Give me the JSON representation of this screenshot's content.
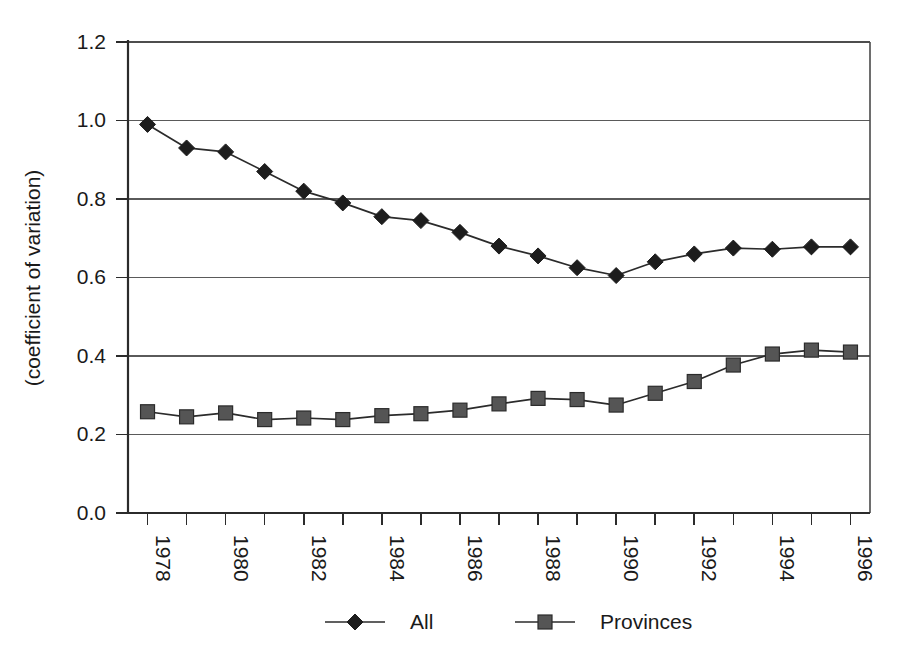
{
  "chart_data": {
    "type": "line",
    "title": "",
    "subtitle": "",
    "xlabel": "",
    "ylabel": "(coefficient of variation)",
    "grid": true,
    "legend_position": "bottom",
    "xlim": [
      1978,
      1997
    ],
    "ylim": [
      0.0,
      1.2
    ],
    "ytick_labels": [
      "0.0",
      "0.2",
      "0.4",
      "0.6",
      "0.8",
      "1.0",
      "1.2"
    ],
    "ytick_values": [
      0.0,
      0.2,
      0.4,
      0.6,
      0.8,
      1.0,
      1.2
    ],
    "x": [
      1978,
      1979,
      1980,
      1981,
      1982,
      1983,
      1984,
      1985,
      1986,
      1987,
      1988,
      1989,
      1990,
      1991,
      1992,
      1993,
      1994,
      1995,
      1996
    ],
    "xtick_labels": [
      "1978",
      "",
      "1980",
      "",
      "1982",
      "",
      "1984",
      "",
      "1986",
      "",
      "1988",
      "",
      "1990",
      "",
      "1992",
      "",
      "1994",
      "",
      "1996"
    ],
    "xtick_labels_shown": [
      "1978",
      "1980",
      "1982",
      "1984",
      "1986",
      "1988",
      "1990",
      "1992",
      "1994",
      "1996"
    ],
    "series": [
      {
        "name": "All",
        "marker": "diamond",
        "color": "#1d1d1d",
        "values": [
          0.99,
          0.93,
          0.92,
          0.87,
          0.82,
          0.79,
          0.755,
          0.745,
          0.715,
          0.68,
          0.655,
          0.625,
          0.605,
          0.64,
          0.66,
          0.675,
          0.672,
          0.678,
          0.678
        ]
      },
      {
        "name": "Provinces",
        "marker": "square",
        "color": "#555555",
        "values": [
          0.258,
          0.245,
          0.255,
          0.238,
          0.242,
          0.238,
          0.248,
          0.253,
          0.262,
          0.278,
          0.292,
          0.289,
          0.275,
          0.305,
          0.335,
          0.377,
          0.405,
          0.415,
          0.41
        ]
      }
    ]
  },
  "legend": {
    "entries": [
      {
        "label": "All",
        "marker": "diamond"
      },
      {
        "label": "Provinces",
        "marker": "square"
      }
    ]
  },
  "axes": {
    "y_title": "(coefficient of variation)"
  }
}
